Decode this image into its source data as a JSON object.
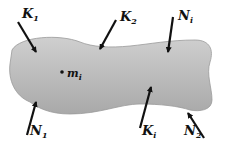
{
  "diagram": {
    "body": {
      "name": "rigid body",
      "fill_top": "#c9c9c9",
      "fill_bottom": "#a8a8a8"
    },
    "mass_point": {
      "symbol": "m",
      "subscript": "i",
      "x": 62,
      "y": 72
    },
    "forces": [
      {
        "id": "K1",
        "symbol": "K",
        "subscript": "1",
        "label_x": 16,
        "label_y": 18
      },
      {
        "id": "K2",
        "symbol": "K",
        "subscript": "2",
        "label_x": 118,
        "label_y": 21
      },
      {
        "id": "Ni_top",
        "symbol": "N",
        "subscript": "i",
        "label_x": 178,
        "label_y": 20
      },
      {
        "id": "N1",
        "symbol": "N",
        "subscript": "1",
        "label_x": 30,
        "label_y": 137
      },
      {
        "id": "Ki",
        "symbol": "K",
        "subscript": "i",
        "label_x": 142,
        "label_y": 137
      },
      {
        "id": "N2",
        "symbol": "N",
        "subscript": "2",
        "label_x": 184,
        "label_y": 137
      }
    ]
  }
}
